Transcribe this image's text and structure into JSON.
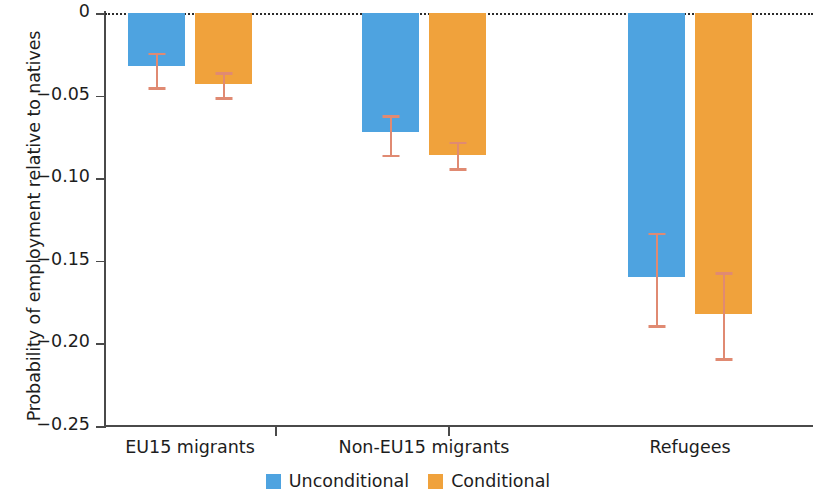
{
  "chart_data": {
    "type": "bar",
    "title": "",
    "subtitle": "",
    "xlabel": "",
    "ylabel": "Probability of employment relative to natives",
    "categories": [
      "EU15 migrants",
      "Non-EU15 migrants",
      "Refugees"
    ],
    "ylim": [
      -0.25,
      0
    ],
    "yticks": [
      0,
      -0.05,
      -0.1,
      -0.15,
      -0.2,
      -0.25
    ],
    "ytick_labels": [
      "0",
      "−0.05",
      "−0.10",
      "−0.15",
      "−0.20",
      "−0.25"
    ],
    "grid": false,
    "zero_reference_line": true,
    "legend_position": "bottom-center",
    "orientation": "vertical",
    "series": [
      {
        "name": "Unconditional",
        "color": "#4ea3e0",
        "values": [
          -0.032,
          -0.072,
          -0.16
        ],
        "ci_low": [
          -0.045,
          -0.086,
          -0.189
        ],
        "ci_high": [
          -0.024,
          -0.062,
          -0.133
        ]
      },
      {
        "name": "Conditional",
        "color": "#f0a23c",
        "values": [
          -0.043,
          -0.086,
          -0.182
        ],
        "ci_low": [
          -0.051,
          -0.094,
          -0.209
        ],
        "ci_high": [
          -0.036,
          -0.078,
          -0.157
        ]
      }
    ],
    "error_bar_color": "#e08a72"
  },
  "legend": {
    "items": [
      {
        "label": "Unconditional",
        "swatch": "legend-swatch-blue"
      },
      {
        "label": "Conditional",
        "swatch": "legend-swatch-orange"
      }
    ]
  }
}
